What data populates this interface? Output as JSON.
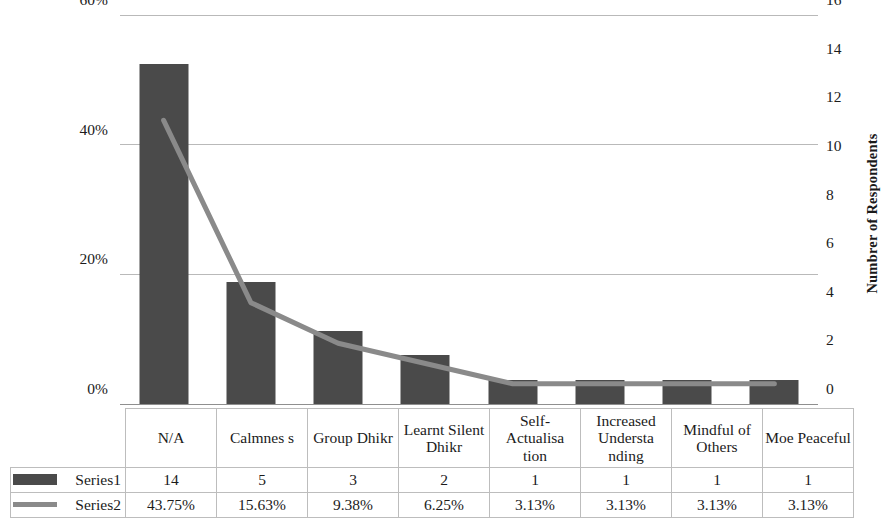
{
  "chart_data": {
    "type": "bar",
    "title": "",
    "xlabel": "",
    "ylabel": "Percentages",
    "y2label": "Numbrer of Respondents",
    "grid": true,
    "legend_position": "data-table",
    "ylim": [
      0,
      60
    ],
    "y2lim": [
      0,
      16
    ],
    "yticks": [
      "0%",
      "20%",
      "40%",
      "60%"
    ],
    "ytick_values": [
      0,
      20,
      40,
      60
    ],
    "y2ticks": [
      "0",
      "2",
      "4",
      "6",
      "8",
      "10",
      "12",
      "14",
      "16"
    ],
    "y2tick_values": [
      0,
      2,
      4,
      6,
      8,
      10,
      12,
      14,
      16
    ],
    "categories": [
      "N/A",
      "Calmnes s",
      "Group Dhikr",
      "Learnt Silent Dhikr",
      "Self- Actualisa tion",
      "Increased Understa nding",
      "Mindful of Others",
      "Moe Peaceful"
    ],
    "series": [
      {
        "name": "Series1",
        "type": "bar",
        "axis": "right",
        "color": "#4a4a4a",
        "values": [
          14,
          5,
          3,
          2,
          1,
          1,
          1,
          1
        ],
        "labels": [
          "14",
          "5",
          "3",
          "2",
          "1",
          "1",
          "1",
          "1"
        ]
      },
      {
        "name": "Series2",
        "type": "line",
        "axis": "left",
        "color": "#8a8a8a",
        "values": [
          43.75,
          15.63,
          9.38,
          6.25,
          3.13,
          3.13,
          3.13,
          3.13
        ],
        "labels": [
          "43.75%",
          "15.63%",
          "9.38%",
          "6.25%",
          "3.13%",
          "3.13%",
          "3.13%",
          "3.13%"
        ]
      }
    ]
  },
  "axes": {
    "left_title": "Percentages",
    "right_title": "Numbrer of Respondents"
  },
  "table": {
    "row_labels": [
      "Series1",
      "Series2"
    ],
    "categories": [
      "N/A",
      "Calmnes s",
      "Group Dhikr",
      "Learnt Silent Dhikr",
      "Self- Actualisa tion",
      "Increased Understa nding",
      "Mindful of Others",
      "Moe Peaceful"
    ],
    "rows": [
      [
        "14",
        "5",
        "3",
        "2",
        "1",
        "1",
        "1",
        "1"
      ],
      [
        "43.75%",
        "15.63%",
        "9.38%",
        "6.25%",
        "3.13%",
        "3.13%",
        "3.13%",
        "3.13%"
      ]
    ]
  }
}
